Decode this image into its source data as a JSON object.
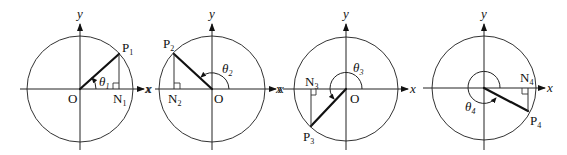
{
  "figure": {
    "panels": [
      {
        "id": 1,
        "point_label": "P",
        "point_sub": "1",
        "foot_label": "N",
        "foot_sub": "1",
        "angle_label": "θ",
        "angle_sub": "1",
        "origin_label": "O",
        "x_label": "x",
        "y_label": "y",
        "quadrant": "I"
      },
      {
        "id": 2,
        "point_label": "P",
        "point_sub": "2",
        "foot_label": "N",
        "foot_sub": "2",
        "angle_label": "θ",
        "angle_sub": "2",
        "origin_label": "O",
        "x_label": "x",
        "y_label": "y",
        "quadrant": "II"
      },
      {
        "id": 3,
        "point_label": "P",
        "point_sub": "3",
        "foot_label": "N",
        "foot_sub": "3",
        "angle_label": "θ",
        "angle_sub": "3",
        "origin_label": "O",
        "x_label": "x",
        "y_label": "y",
        "quadrant": "III"
      },
      {
        "id": 4,
        "point_label": "P",
        "point_sub": "4",
        "foot_label": "N",
        "foot_sub": "4",
        "angle_label": "θ",
        "angle_sub": "4",
        "origin_label": "O",
        "x_label": "x",
        "y_label": "y",
        "quadrant": "IV"
      }
    ],
    "neg_x_labels": [
      "x",
      "x"
    ]
  }
}
